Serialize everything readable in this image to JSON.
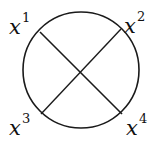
{
  "diagram": {
    "type": "circle-with-crossing-chords",
    "stroke_color": "#1a1a1a",
    "background": "#ffffff",
    "circle": {
      "cx": 81,
      "cy": 70,
      "r": 58
    },
    "chords": [
      {
        "from": "x1",
        "to": "x4"
      },
      {
        "from": "x2",
        "to": "x3"
      }
    ],
    "labels": [
      {
        "id": "x1",
        "base": "x",
        "sup": "1"
      },
      {
        "id": "x2",
        "base": "x",
        "sup": "2"
      },
      {
        "id": "x3",
        "base": "x",
        "sup": "3"
      },
      {
        "id": "x4",
        "base": "x",
        "sup": "4"
      }
    ]
  }
}
